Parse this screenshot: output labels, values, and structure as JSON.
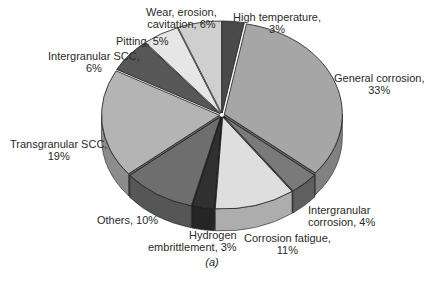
{
  "chart_data": {
    "type": "pie",
    "style": "3d-exploded-tilted",
    "title": "",
    "caption": "(a)",
    "start_angle": "12 o'clock",
    "direction": "clockwise",
    "slices": [
      {
        "label": "High temperature",
        "value": 3,
        "display": "High temperature,\n3%",
        "color": "#4a4a4a"
      },
      {
        "label": "General corrosion",
        "value": 33,
        "display": "General corrosion,\n33%",
        "color": "#a6a6a6"
      },
      {
        "label": "Intergranular corrosion",
        "value": 4,
        "display": "Intergranular\ncorrosion, 4%",
        "color": "#7a7a7a"
      },
      {
        "label": "Corrosion fatigue",
        "value": 11,
        "display": "Corrosion fatigue,\n11%",
        "color": "#dedede"
      },
      {
        "label": "Hydrogen embrittlement",
        "value": 3,
        "display": "Hydrogen\nembrittlement, 3%",
        "color": "#303030"
      },
      {
        "label": "Others",
        "value": 10,
        "display": "Others, 10%",
        "color": "#6e6e6e"
      },
      {
        "label": "Transgranular SCC",
        "value": 19,
        "display": "Transgranular SCC,\n19%",
        "color": "#b4b4b4"
      },
      {
        "label": "Intergranular SCC",
        "value": 6,
        "display": "Intergranular SCC,\n6%",
        "color": "#575757"
      },
      {
        "label": "Pitting",
        "value": 5,
        "display": "Pitting, 5%",
        "color": "#e6e6e6"
      },
      {
        "label": "Wear, erosion, cavitation",
        "value": 6,
        "display": "Wear, erosion,\ncavitation, 6%",
        "color": "#cfcfcf"
      }
    ],
    "legend": "none (labels placed around slices)"
  },
  "labels": {
    "high_temp": [
      "High temperature,",
      "3%"
    ],
    "general": [
      "General corrosion,",
      "33%"
    ],
    "inter_corr": [
      "Intergranular",
      "corrosion, 4%"
    ],
    "fatigue": [
      "Corrosion fatigue,",
      "11%"
    ],
    "hydrogen": [
      "Hydrogen",
      "embrittlement, 3%"
    ],
    "others": [
      "Others, 10%"
    ],
    "trans_scc": [
      "Transgranular SCC,",
      "19%"
    ],
    "inter_scc": [
      "Intergranular SCC,",
      "6%"
    ],
    "pitting": [
      "Pitting, 5%"
    ],
    "wear": [
      "Wear, erosion,",
      "cavitation, 6%"
    ]
  },
  "caption": "(a)"
}
